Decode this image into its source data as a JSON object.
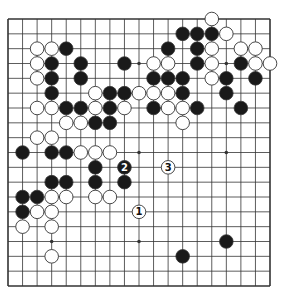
{
  "diagram": {
    "type": "go-board",
    "size": 19,
    "geometry": {
      "left": 8,
      "top": 19,
      "right": 270,
      "bottom": 286,
      "stone_radius": 6.8
    },
    "colors": {
      "line": "#333333",
      "black_stone": "#1a1a1a",
      "white_stone": "#ffffff",
      "stone_outline": "#333333",
      "background": "#ffffff"
    },
    "star_points": [
      [
        3,
        3
      ],
      [
        3,
        9
      ],
      [
        3,
        15
      ],
      [
        9,
        3
      ],
      [
        9,
        9
      ],
      [
        9,
        15
      ],
      [
        15,
        3
      ],
      [
        15,
        9
      ],
      [
        15,
        15
      ]
    ],
    "black_stones": [
      [
        1,
        12
      ],
      [
        1,
        13
      ],
      [
        1,
        14
      ],
      [
        2,
        4
      ],
      [
        2,
        11
      ],
      [
        2,
        13
      ],
      [
        3,
        3
      ],
      [
        3,
        5
      ],
      [
        3,
        8
      ],
      [
        3,
        13
      ],
      [
        3,
        16
      ],
      [
        4,
        3
      ],
      [
        4,
        5
      ],
      [
        4,
        10
      ],
      [
        4,
        11
      ],
      [
        4,
        12
      ],
      [
        4,
        15
      ],
      [
        4,
        17
      ],
      [
        5,
        3
      ],
      [
        5,
        7
      ],
      [
        5,
        8
      ],
      [
        5,
        12
      ],
      [
        5,
        15
      ],
      [
        6,
        4
      ],
      [
        6,
        5
      ],
      [
        6,
        7
      ],
      [
        6,
        10
      ],
      [
        6,
        13
      ],
      [
        6,
        16
      ],
      [
        7,
        6
      ],
      [
        7,
        7
      ],
      [
        9,
        1
      ],
      [
        9,
        3
      ],
      [
        9,
        4
      ],
      [
        10,
        6
      ],
      [
        11,
        3
      ],
      [
        11,
        4
      ],
      [
        11,
        6
      ],
      [
        11,
        8
      ],
      [
        12,
        1
      ],
      [
        12,
        2
      ],
      [
        13,
        1
      ],
      [
        15,
        15
      ],
      [
        16,
        12
      ]
    ],
    "white_stones": [
      [
        0,
        14
      ],
      [
        1,
        15
      ],
      [
        2,
        2
      ],
      [
        2,
        3
      ],
      [
        2,
        14
      ],
      [
        2,
        16
      ],
      [
        2,
        17
      ],
      [
        3,
        2
      ],
      [
        3,
        10
      ],
      [
        3,
        11
      ],
      [
        3,
        14
      ],
      [
        3,
        17
      ],
      [
        3,
        18
      ],
      [
        4,
        2
      ],
      [
        4,
        14
      ],
      [
        5,
        6
      ],
      [
        5,
        9
      ],
      [
        5,
        10
      ],
      [
        5,
        11
      ],
      [
        6,
        2
      ],
      [
        6,
        3
      ],
      [
        6,
        6
      ],
      [
        6,
        8
      ],
      [
        6,
        11
      ],
      [
        6,
        12
      ],
      [
        7,
        4
      ],
      [
        7,
        5
      ],
      [
        7,
        12
      ],
      [
        8,
        2
      ],
      [
        8,
        3
      ],
      [
        9,
        5
      ],
      [
        9,
        6
      ],
      [
        9,
        7
      ],
      [
        12,
        3
      ],
      [
        12,
        4
      ],
      [
        12,
        6
      ],
      [
        12,
        7
      ],
      [
        13,
        2
      ],
      [
        13,
        3
      ],
      [
        14,
        1
      ],
      [
        14,
        3
      ],
      [
        16,
        3
      ]
    ],
    "numbered_moves": [
      {
        "label": "1",
        "color": "white",
        "row": 13,
        "col": 9
      },
      {
        "label": "2",
        "color": "black",
        "row": 10,
        "col": 8
      },
      {
        "label": "3",
        "color": "white",
        "row": 10,
        "col": 11
      }
    ]
  }
}
